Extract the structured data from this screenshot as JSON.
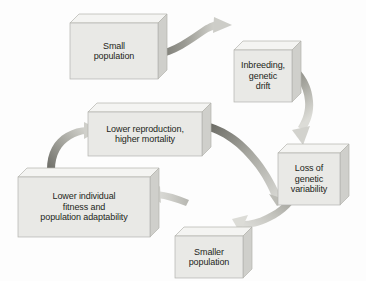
{
  "figure": {
    "background_color": "#fdfdfd",
    "box_face_color": "#e9e9e6",
    "box_top_color": "#f4f4f2",
    "box_side_color": "#cfcfcb",
    "box_edge_color": "#b3b3ae",
    "text_color": "#231f20",
    "arrow_dark_color": "#6e6e6a",
    "arrow_light_color": "#d8d8d4"
  },
  "nodes": [
    {
      "id": "small-population",
      "label": "Small\npopulation",
      "x": 70,
      "y": 14,
      "w": 88,
      "h": 56,
      "depth": 9
    },
    {
      "id": "inbreeding-genetic-drift",
      "label": "Inbreeding,\ngenetic\ndrift",
      "x": 234,
      "y": 41,
      "w": 58,
      "h": 52,
      "depth": 9
    },
    {
      "id": "loss-of-genetic-variability",
      "label": "Loss of\ngenetic\nvariability",
      "x": 278,
      "y": 144,
      "w": 62,
      "h": 52,
      "depth": 9
    },
    {
      "id": "smaller-population",
      "label": "Smaller\npopulation",
      "x": 175,
      "y": 227,
      "w": 68,
      "h": 42,
      "depth": 9
    },
    {
      "id": "lower-individual-fitness",
      "label": "Lower individual\nfitness and\npopulation adaptability",
      "x": 18,
      "y": 168,
      "w": 132,
      "h": 60,
      "depth": 9
    },
    {
      "id": "lower-reproduction-higher-mortality",
      "label": "Lower reproduction,\nhigher mortality",
      "x": 88,
      "y": 103,
      "w": 114,
      "h": 44,
      "depth": 9
    }
  ],
  "arrows": [
    {
      "id": "arrow-small-population-to-inbreeding",
      "from": "small-population",
      "to": "inbreeding-genetic-drift"
    },
    {
      "id": "arrow-inbreeding-to-loss-of-variability",
      "from": "inbreeding-genetic-drift",
      "to": "loss-of-genetic-variability"
    },
    {
      "id": "arrow-loss-of-variability-to-smaller-population",
      "from": "loss-of-genetic-variability",
      "to": "smaller-population"
    },
    {
      "id": "arrow-smaller-population-to-lower-fitness",
      "from": "smaller-population",
      "to": "lower-individual-fitness"
    },
    {
      "id": "arrow-lower-fitness-to-lower-reproduction",
      "from": "lower-individual-fitness",
      "to": "lower-reproduction-higher-mortality"
    },
    {
      "id": "arrow-lower-reproduction-to-loss-of-variability",
      "from": "lower-reproduction-higher-mortality",
      "to": "loss-of-genetic-variability"
    }
  ]
}
